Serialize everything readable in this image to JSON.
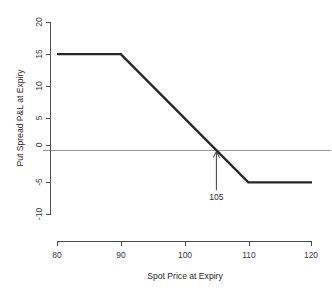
{
  "chart_data": {
    "type": "line",
    "title": "",
    "xlabel": "Spot Price at Expiry",
    "ylabel": "Put Spread P&L at Expiry",
    "xlim": [
      80,
      120
    ],
    "ylim": [
      -10,
      20
    ],
    "xticks": [
      80,
      90,
      100,
      110,
      120
    ],
    "yticks": [
      20,
      15,
      10,
      5,
      0,
      -5,
      -10
    ],
    "xtick_labels": [
      "80",
      "90",
      "100",
      "110",
      "120"
    ],
    "ytick_labels": [
      "20",
      "15",
      "10",
      "5",
      "0",
      "-5",
      "-10"
    ],
    "grid": false,
    "legend": false,
    "zero_line": true,
    "zero_line_color": "#9a9a9a",
    "line_color": "#262626",
    "series": [
      {
        "name": "Put Spread P&L at Expiry",
        "x": [
          80,
          90,
          110,
          120
        ],
        "values": [
          15,
          15,
          -5,
          -5
        ]
      }
    ],
    "annotations": [
      {
        "label": "105",
        "x": 105,
        "y": 0,
        "kind": "breakeven-arrow"
      }
    ]
  },
  "axes": {
    "y_tick_0": "20",
    "y_tick_1": "15",
    "y_tick_2": "10",
    "y_tick_3": "5",
    "y_tick_4": "0",
    "y_tick_5": "-5",
    "y_tick_6": "-10",
    "x_tick_0": "80",
    "x_tick_1": "90",
    "x_tick_2": "100",
    "x_tick_3": "110",
    "x_tick_4": "120",
    "x_title": "Spot Price at Expiry",
    "y_title": "Put Spread P&L at Expiry"
  },
  "annotation": {
    "breakeven_label": "105"
  }
}
